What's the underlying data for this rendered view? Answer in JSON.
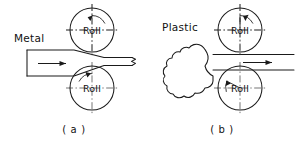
{
  "figure": {
    "background_color": "#ffffff",
    "line_color": "#1a1a1a",
    "centerline_color": "#3a3a3a"
  },
  "panels": [
    {
      "id": "a",
      "caption": "( a )",
      "material_label": "Metal",
      "feed_direction": "right",
      "rolls": [
        {
          "position": "upper",
          "label": "Roll",
          "rotation": "clockwise",
          "center_x": 92,
          "center_y": 30,
          "radius": 22
        },
        {
          "position": "lower",
          "label": "Roll",
          "rotation": "counterclockwise",
          "center_x": 92,
          "center_y": 88,
          "radius": 22
        }
      ],
      "workpiece": {
        "shape": "tapered-slab",
        "entry_thickness": "thick",
        "exit_thickness": "thin",
        "end_marker": "break-line"
      }
    },
    {
      "id": "b",
      "caption": "( b )",
      "material_label": "Plastic",
      "feed_direction": "right",
      "rolls": [
        {
          "position": "upper",
          "label": "Roll",
          "rotation": "clockwise",
          "center_x": 240,
          "center_y": 30,
          "radius": 22
        },
        {
          "position": "lower",
          "label": "Roll",
          "rotation": "counterclockwise",
          "center_x": 240,
          "center_y": 88,
          "radius": 22
        }
      ],
      "workpiece": {
        "shape": "irregular-blob",
        "entry_thickness": "lumpy",
        "exit_thickness": "thin-sheet",
        "end_marker": "none"
      }
    }
  ]
}
